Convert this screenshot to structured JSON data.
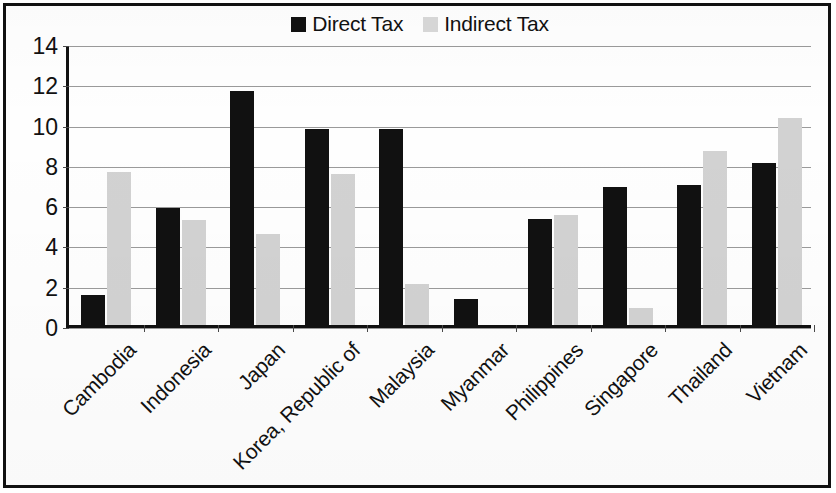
{
  "figure": {
    "frame_color": "#111111",
    "background_color": "#ffffff"
  },
  "legend": {
    "position": "top-center",
    "entries": [
      {
        "label": "Direct Tax",
        "color": "#111111",
        "icon": "filled-square-icon"
      },
      {
        "label": "Indirect Tax",
        "color": "#d6d6d6",
        "icon": "filled-square-icon"
      }
    ]
  },
  "axes": {
    "y_ticks": [
      "14",
      "12",
      "10",
      "8",
      "6",
      "4",
      "2",
      "0"
    ],
    "y_min": 0,
    "y_max": 14,
    "y_step": 2,
    "grid": true
  },
  "chart_data": {
    "type": "bar",
    "title": "",
    "subtitle": "",
    "xlabel": "",
    "ylabel": "",
    "ylim": [
      0,
      14
    ],
    "ytick_step": 2,
    "grid": true,
    "legend_position": "top-center",
    "categories": [
      "Cambodia",
      "Indonesia",
      "Japan",
      "Korea, Republic of",
      "Malaysia",
      "Myanmar",
      "Philippines",
      "Singapore",
      "Thailand",
      "Vietnam"
    ],
    "series": [
      {
        "name": "Direct Tax",
        "color": "#111111",
        "values": [
          1.5,
          5.8,
          11.6,
          9.75,
          9.75,
          1.3,
          5.25,
          6.85,
          6.95,
          8.05
        ]
      },
      {
        "name": "Indirect Tax",
        "color": "#d2d2d2",
        "values": [
          7.6,
          5.2,
          4.5,
          7.5,
          2.05,
          0,
          5.45,
          0.85,
          8.65,
          10.3
        ]
      }
    ]
  }
}
